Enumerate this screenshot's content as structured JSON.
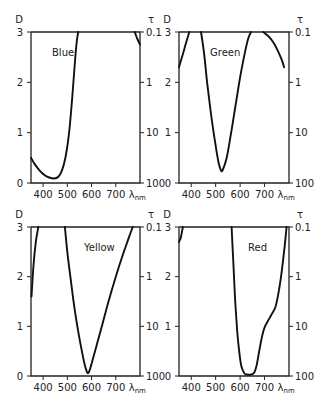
{
  "chart_data": [
    {
      "type": "line",
      "title": "Blue",
      "xlabel": "λnm",
      "ylabel_left": "D",
      "ylabel_right": "τ",
      "xlim": [
        350,
        800
      ],
      "ylim": [
        0,
        3
      ],
      "x_ticks": [
        400,
        500,
        600,
        700
      ],
      "y_ticks_left": [
        0,
        1,
        2,
        3
      ],
      "y_ticks_right": [
        "100",
        "10",
        "1",
        "0.1"
      ],
      "grid": false,
      "series": [
        {
          "name": "Blue segment 1",
          "x": [
            350,
            365,
            385,
            405,
            425,
            445,
            462,
            478,
            492,
            505,
            515,
            525,
            533,
            540,
            545
          ],
          "y": [
            0.5,
            0.38,
            0.25,
            0.16,
            0.11,
            0.09,
            0.12,
            0.25,
            0.5,
            0.9,
            1.4,
            2.0,
            2.5,
            2.85,
            3.0
          ]
        },
        {
          "name": "Blue segment 2",
          "x": [
            778,
            790,
            800
          ],
          "y": [
            3.0,
            2.85,
            2.75
          ]
        }
      ]
    },
    {
      "type": "line",
      "title": "Green",
      "xlabel": "λnm",
      "ylabel_left": "D",
      "ylabel_right": "τ",
      "xlim": [
        350,
        800
      ],
      "ylim": [
        0,
        3
      ],
      "x_ticks": [
        400,
        500,
        600,
        700
      ],
      "y_ticks_left": [
        0,
        1,
        2,
        3
      ],
      "y_ticks_right": [
        "100",
        "10",
        "1",
        "0.1"
      ],
      "grid": false,
      "series": [
        {
          "name": "Green segment 1",
          "x": [
            350,
            365,
            380,
            392
          ],
          "y": [
            2.3,
            2.55,
            2.8,
            3.0
          ]
        },
        {
          "name": "Green segment 2",
          "x": [
            440,
            452,
            465,
            480,
            495,
            510,
            522,
            530,
            545,
            560,
            580,
            600,
            620,
            635,
            645
          ],
          "y": [
            3.0,
            2.6,
            2.0,
            1.4,
            0.9,
            0.45,
            0.25,
            0.27,
            0.5,
            0.9,
            1.5,
            2.1,
            2.6,
            2.9,
            3.0
          ]
        },
        {
          "name": "Green segment 3",
          "x": [
            695,
            715,
            735,
            755,
            770,
            780
          ],
          "y": [
            3.0,
            2.92,
            2.8,
            2.62,
            2.45,
            2.3
          ]
        }
      ]
    },
    {
      "type": "line",
      "title": "Yellow",
      "xlabel": "λnm",
      "ylabel_left": "D",
      "ylabel_right": "τ",
      "xlim": [
        350,
        800
      ],
      "ylim": [
        0,
        3
      ],
      "x_ticks": [
        400,
        500,
        600,
        700
      ],
      "y_ticks_left": [
        0,
        1,
        2,
        3
      ],
      "y_ticks_right": [
        "100",
        "10",
        "1",
        "0.1"
      ],
      "grid": false,
      "series": [
        {
          "name": "Yellow segment 1",
          "x": [
            352,
            360,
            370,
            380
          ],
          "y": [
            1.6,
            2.2,
            2.7,
            3.0
          ]
        },
        {
          "name": "Yellow segment 2",
          "x": [
            490,
            500,
            515,
            530,
            545,
            560,
            572,
            582,
            590,
            600,
            620,
            645,
            670,
            700,
            730,
            755,
            770
          ],
          "y": [
            3.0,
            2.5,
            1.9,
            1.35,
            0.9,
            0.5,
            0.22,
            0.07,
            0.09,
            0.25,
            0.6,
            1.05,
            1.5,
            2.0,
            2.45,
            2.8,
            3.0
          ]
        }
      ]
    },
    {
      "type": "line",
      "title": "Red",
      "xlabel": "λnm",
      "ylabel_left": "D",
      "ylabel_right": "τ",
      "xlim": [
        350,
        800
      ],
      "ylim": [
        0,
        3
      ],
      "x_ticks": [
        400,
        500,
        600,
        700
      ],
      "y_ticks_left": [
        0,
        1,
        2,
        3
      ],
      "y_ticks_right": [
        "100",
        "10",
        "1",
        "0.1"
      ],
      "grid": false,
      "series": [
        {
          "name": "Red segment 1",
          "x": [
            350,
            357,
            362,
            366
          ],
          "y": [
            2.7,
            2.78,
            2.9,
            3.0
          ]
        },
        {
          "name": "Red segment 2",
          "x": [
            565,
            572,
            580,
            588,
            595,
            605,
            618,
            630,
            645,
            658,
            668,
            678,
            690,
            700,
            715,
            730,
            745,
            758,
            770,
            782,
            790
          ],
          "y": [
            3.0,
            2.3,
            1.5,
            0.9,
            0.55,
            0.2,
            0.05,
            0.03,
            0.03,
            0.07,
            0.22,
            0.5,
            0.8,
            0.98,
            1.12,
            1.25,
            1.4,
            1.7,
            2.1,
            2.6,
            3.0
          ]
        }
      ]
    }
  ],
  "panels": [
    {
      "name": "Blue",
      "ylabel_left": "D",
      "ylabel_right": "τ",
      "xunit": "λ",
      "xunit_sub": "nm"
    },
    {
      "name": "Green",
      "ylabel_left": "D",
      "ylabel_right": "τ",
      "xunit": "λ",
      "xunit_sub": "nm"
    },
    {
      "name": "Yellow",
      "ylabel_left": "D",
      "ylabel_right": "τ",
      "xunit": "λ",
      "xunit_sub": "nm"
    },
    {
      "name": "Red",
      "ylabel_left": "D",
      "ylabel_right": "τ",
      "xunit": "λ",
      "xunit_sub": "nm"
    }
  ]
}
